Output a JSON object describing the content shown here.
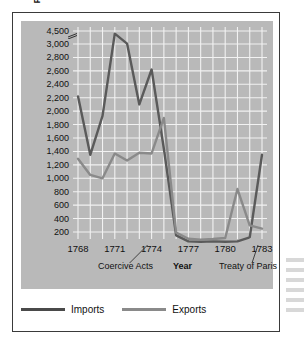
{
  "chart_data": {
    "type": "line",
    "title": "",
    "xlabel": "Year",
    "ylabel": "Pounds sterling (in thousands)",
    "x": [
      1768,
      1769,
      1770,
      1771,
      1772,
      1773,
      1774,
      1775,
      1776,
      1777,
      1778,
      1779,
      1780,
      1781,
      1782,
      1783
    ],
    "x_tick_labels": [
      "1768",
      "1771",
      "1774",
      "1777",
      "1780",
      "1783"
    ],
    "x_tick_values": [
      1768,
      1771,
      1774,
      1777,
      1780,
      1783
    ],
    "y_tick_labels": [
      "4,500",
      "3,000",
      "2,800",
      "2,600",
      "2,400",
      "2,200",
      "2,000",
      "1,800",
      "1,600",
      "1,400",
      "1,200",
      "1,000",
      "800",
      "600",
      "400",
      "200"
    ],
    "y_tick_values": [
      4500,
      3000,
      2800,
      2600,
      2400,
      2200,
      2000,
      1800,
      1600,
      1400,
      1200,
      1000,
      800,
      600,
      400,
      200
    ],
    "ylim": [
      0,
      4500
    ],
    "axis_break": true,
    "axis_break_note": "y-axis compressed between 3,000 and 4,500",
    "grid": true,
    "legend_position": "below",
    "series": [
      {
        "name": "Imports",
        "color": "#5a5a5a",
        "values": [
          2220,
          1350,
          1930,
          4200,
          3050,
          2100,
          2620,
          1440,
          150,
          60,
          55,
          60,
          55,
          60,
          120,
          1350
        ]
      },
      {
        "name": "Exports",
        "color": "#8a8a8a",
        "values": [
          1290,
          1050,
          1000,
          1370,
          1265,
          1380,
          1370,
          1900,
          190,
          100,
          85,
          95,
          110,
          840,
          300,
          250
        ]
      }
    ],
    "annotations": [
      {
        "label": "Coercive Acts",
        "year": 1774
      },
      {
        "label": "Treaty of Paris",
        "year": 1783
      }
    ]
  },
  "legend": {
    "items": [
      {
        "label": "Imports",
        "color": "#4a4a4a"
      },
      {
        "label": "Exports",
        "color": "#8a8a8a"
      }
    ]
  },
  "axis": {
    "x_title": "Year",
    "y_title": "Pounds sterling (in thousands)"
  }
}
